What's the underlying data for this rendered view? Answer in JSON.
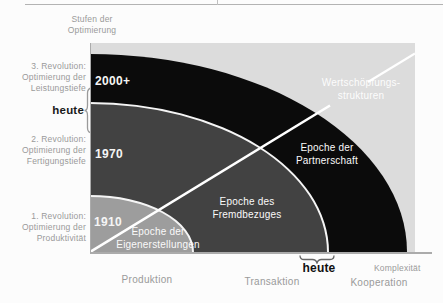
{
  "y_axis": {
    "title_lines": [
      "Stufen der",
      "Optimierung"
    ],
    "stages": [
      {
        "lines": [
          "3. Revolution:",
          "Optimierung der",
          "Leistungstiefe"
        ]
      },
      {
        "lines": [
          "2. Revolution:",
          "Optimierung der",
          "Fertigungstiefe"
        ]
      },
      {
        "lines": [
          "1. Revolution:",
          "Optimierung der",
          "Produktivität"
        ]
      }
    ],
    "heute_label": "heute"
  },
  "x_axis": {
    "labels": [
      "Produktion",
      "Transaktion",
      "Kooperation"
    ],
    "complexity_label": "Komplexität",
    "heute_label": "heute"
  },
  "chart": {
    "eras": [
      {
        "year": "1910",
        "name_lines": [
          "Epoche der",
          "Eigenerstellungen"
        ],
        "color": "#9d9d9d"
      },
      {
        "year": "1970",
        "name_lines": [
          "Epoche des",
          "Fremdbezuges"
        ],
        "color": "#424242"
      },
      {
        "year": "2000+",
        "name_lines": [
          "Epoche der",
          "Partnerschaft"
        ],
        "color": "#0b0b0b"
      }
    ],
    "diagonal_label_lines": [
      "Wertschöpfungs-",
      "strukturen"
    ],
    "outer_color": "#dcdcdc"
  },
  "colors": {
    "separator": "#f5f5f5",
    "axis": "#ababab",
    "label_gray": "#9a9a9a",
    "diagonal_line": "#ffffff",
    "heute_text": "#1a1a1a"
  }
}
